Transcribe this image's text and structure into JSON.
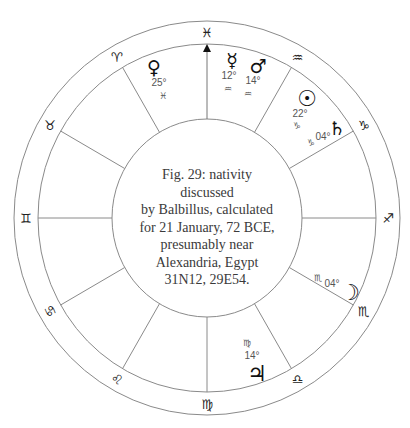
{
  "caption": {
    "lines": [
      "Fig. 29: nativity",
      "discussed",
      "by Balbillus, calculated",
      "for 21 January, 72 BCE,",
      "presumably near",
      "Alexandria, Egypt",
      "31N12, 29E54."
    ]
  },
  "wheel": {
    "marker": {
      "name": "midheaven-arrow",
      "sign": "Pisces"
    },
    "signs": [
      {
        "name": "Pisces",
        "glyph": "♓"
      },
      {
        "name": "Aquarius",
        "glyph": "♒"
      },
      {
        "name": "Capricorn",
        "glyph": "♑"
      },
      {
        "name": "Sagittarius",
        "glyph": "♐"
      },
      {
        "name": "Scorpio",
        "glyph": "♏"
      },
      {
        "name": "Libra",
        "glyph": "♎"
      },
      {
        "name": "Virgo",
        "glyph": "♍"
      },
      {
        "name": "Leo",
        "glyph": "♌"
      },
      {
        "name": "Cancer",
        "glyph": "♋"
      },
      {
        "name": "Gemini",
        "glyph": "♊"
      },
      {
        "name": "Taurus",
        "glyph": "♉"
      },
      {
        "name": "Aries",
        "glyph": "♈"
      }
    ],
    "planets": [
      {
        "name": "Venus",
        "glyph": "♀",
        "degree": "25°",
        "sign_glyph": "♓"
      },
      {
        "name": "Mercury",
        "glyph": "☿",
        "degree": "12°",
        "sign_glyph": "♒"
      },
      {
        "name": "Mars",
        "glyph": "♂",
        "degree": "14°",
        "sign_glyph": "♒"
      },
      {
        "name": "Sun",
        "glyph": "☉",
        "degree": "22°",
        "sign_glyph": "♑"
      },
      {
        "name": "Saturn",
        "glyph": "♄",
        "degree": "04°",
        "sign_glyph": "♑"
      },
      {
        "name": "Moon",
        "glyph": "☽",
        "degree": "04°",
        "sign_glyph": "♏"
      },
      {
        "name": "Jupiter",
        "glyph": "♃",
        "degree": "14°",
        "sign_glyph": "♍"
      }
    ]
  },
  "colors": {
    "line": "#8a8a8a",
    "glyph": "#111111",
    "degree_text": "#555555",
    "caption_text": "#3a3a3a"
  }
}
